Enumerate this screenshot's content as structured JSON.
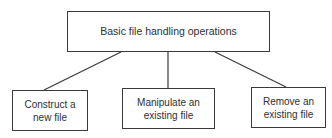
{
  "diagram": {
    "type": "tree",
    "root": {
      "label": "Basic file handling operations"
    },
    "children": [
      {
        "label": "Construct a\nnew file"
      },
      {
        "label": "Manipulate an\nexisting file"
      },
      {
        "label": "Remove an\nexisting file"
      }
    ],
    "colors": {
      "line": "#3a3a3a",
      "text": "#2f2f2f",
      "background": "#ffffff"
    }
  }
}
